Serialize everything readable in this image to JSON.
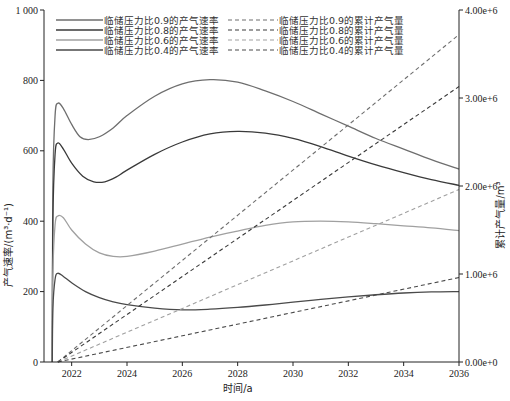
{
  "chart_data": {
    "type": "line",
    "title": "",
    "xlabel": "时间/a",
    "ylabel_left": "产气速率/(m³·d⁻¹)",
    "ylabel_right": "累计产气量/m³",
    "xlim": [
      2021,
      2036
    ],
    "ylim_left": [
      0,
      1000
    ],
    "ylim_right": [
      0,
      4000000
    ],
    "x_ticks": [
      "2022",
      "2024",
      "2026",
      "2028",
      "2030",
      "2032",
      "2034",
      "2036"
    ],
    "x_tick_values": [
      2022,
      2024,
      2026,
      2028,
      2030,
      2032,
      2034,
      2036
    ],
    "y_left_ticks": [
      "0",
      "200",
      "400",
      "600",
      "800",
      "1 000"
    ],
    "y_left_tick_values": [
      0,
      200,
      400,
      600,
      800,
      1000
    ],
    "y_right_ticks": [
      "0.00e+0",
      "1.00e+6",
      "2.00e+6",
      "3.00e+6",
      "4.00e+6"
    ],
    "y_right_tick_values": [
      0,
      1000000,
      2000000,
      3000000,
      4000000
    ],
    "grid": false,
    "legend_position": "top-left, two columns",
    "series": [
      {
        "name": "临储压力比0.9的产气速率",
        "axis": "left",
        "style": "solid",
        "color": "#6e6e6e",
        "x": [
          2021.3,
          2021.32,
          2021.4,
          2021.5,
          2021.7,
          2022.0,
          2022.3,
          2022.6,
          2023.0,
          2023.5,
          2024.0,
          2025.0,
          2026.0,
          2027.0,
          2028.0,
          2029.0,
          2030.0,
          2031.0,
          2032.0,
          2033.0,
          2034.0,
          2035.0,
          2036.0
        ],
        "values": [
          0,
          500,
          700,
          735,
          720,
          675,
          640,
          632,
          640,
          665,
          700,
          755,
          790,
          802,
          795,
          770,
          740,
          705,
          670,
          635,
          605,
          575,
          548
        ]
      },
      {
        "name": "临储压力比0.8的产气速率",
        "axis": "left",
        "style": "solid",
        "color": "#3a3a3a",
        "x": [
          2021.3,
          2021.32,
          2021.4,
          2021.5,
          2021.7,
          2022.0,
          2022.4,
          2022.8,
          2023.2,
          2023.6,
          2024.0,
          2025.0,
          2026.0,
          2027.0,
          2028.0,
          2029.0,
          2030.0,
          2031.0,
          2032.0,
          2033.0,
          2034.0,
          2035.0,
          2036.0
        ],
        "values": [
          0,
          400,
          590,
          622,
          605,
          565,
          528,
          512,
          512,
          525,
          545,
          590,
          625,
          648,
          655,
          650,
          635,
          612,
          585,
          560,
          538,
          518,
          502
        ]
      },
      {
        "name": "临储压力比0.6的产气速率",
        "axis": "left",
        "style": "solid",
        "color": "#a0a0a0",
        "x": [
          2021.3,
          2021.32,
          2021.4,
          2021.5,
          2021.7,
          2022.0,
          2022.5,
          2023.0,
          2023.5,
          2024.0,
          2025.0,
          2026.0,
          2027.0,
          2028.0,
          2029.0,
          2030.0,
          2031.0,
          2032.0,
          2033.0,
          2034.0,
          2035.0,
          2036.0
        ],
        "values": [
          0,
          250,
          390,
          415,
          410,
          375,
          335,
          310,
          300,
          300,
          315,
          335,
          355,
          372,
          388,
          398,
          400,
          398,
          393,
          387,
          381,
          373
        ]
      },
      {
        "name": "临储压力比0.4的产气速率",
        "axis": "left",
        "style": "solid",
        "color": "#4a4a4a",
        "x": [
          2021.3,
          2021.32,
          2021.4,
          2021.5,
          2021.7,
          2022.0,
          2022.5,
          2023.0,
          2023.5,
          2024.0,
          2025.0,
          2026.0,
          2027.0,
          2028.0,
          2029.0,
          2030.0,
          2031.0,
          2032.0,
          2033.0,
          2034.0,
          2035.0,
          2036.0
        ],
        "values": [
          0,
          150,
          235,
          252,
          243,
          225,
          200,
          183,
          171,
          163,
          153,
          148,
          150,
          155,
          162,
          170,
          178,
          185,
          191,
          196,
          199,
          200
        ]
      },
      {
        "name": "临储压力比0.9的累计产气量",
        "axis": "right",
        "style": "dashed",
        "color": "#6e6e6e",
        "x": [
          2021.5,
          2036.0
        ],
        "values": [
          0,
          3720000
        ]
      },
      {
        "name": "临储压力比0.8的累计产气量",
        "axis": "right",
        "style": "dashed",
        "color": "#3a3a3a",
        "x": [
          2021.5,
          2036.0
        ],
        "values": [
          0,
          3130000
        ]
      },
      {
        "name": "临储压力比0.6的累计产气量",
        "axis": "right",
        "style": "dashed",
        "color": "#a0a0a0",
        "x": [
          2021.5,
          2036.0
        ],
        "values": [
          0,
          1960000
        ]
      },
      {
        "name": "临储压力比0.4的累计产气量",
        "axis": "right",
        "style": "dashed",
        "color": "#4a4a4a",
        "x": [
          2021.5,
          2036.0
        ],
        "values": [
          0,
          960000
        ]
      }
    ]
  }
}
